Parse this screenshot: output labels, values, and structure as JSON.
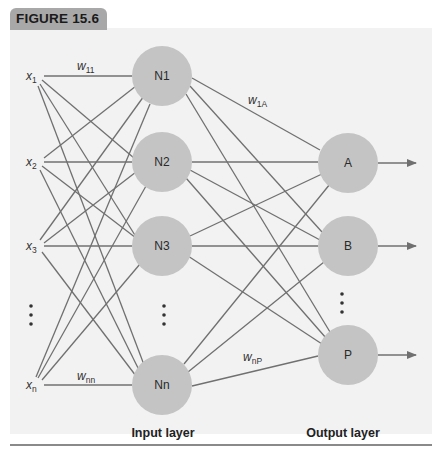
{
  "figure": {
    "label": "FIGURE 15.6"
  },
  "diagram": {
    "type": "neural-network",
    "inputs": [
      {
        "name": "x",
        "sub": "1",
        "y": 76
      },
      {
        "name": "x",
        "sub": "2",
        "y": 162
      },
      {
        "name": "x",
        "sub": "3",
        "y": 246
      },
      {
        "name": "x",
        "sub": "n",
        "y": 385
      }
    ],
    "hidden_nodes": [
      {
        "label": "N1",
        "y": 76
      },
      {
        "label": "N2",
        "y": 162
      },
      {
        "label": "N3",
        "y": 246
      },
      {
        "label": "Nn",
        "y": 385
      }
    ],
    "output_nodes": [
      {
        "label": "A",
        "y": 163
      },
      {
        "label": "B",
        "y": 246
      },
      {
        "label": "P",
        "y": 355
      }
    ],
    "weights": [
      {
        "base": "w",
        "sub": "11"
      },
      {
        "base": "w",
        "sub": "1A"
      },
      {
        "base": "w",
        "sub": "nn"
      },
      {
        "base": "w",
        "sub": "nP"
      }
    ],
    "ellipsis": "⋮",
    "layer_labels": {
      "input": "Input layer",
      "output": "Output layer"
    },
    "colors": {
      "node_fill": "#c4c4c4",
      "edge": "#707070",
      "panel": "#f2f2f2",
      "tab": "#a8a8a8"
    }
  }
}
